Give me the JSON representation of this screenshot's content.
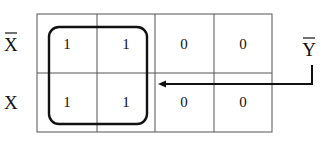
{
  "diagram": {
    "type": "karnaugh-map",
    "row_labels": [
      {
        "text": "X",
        "overline": true
      },
      {
        "text": "X",
        "overline": false
      }
    ],
    "cells": [
      [
        "1",
        "1",
        "0",
        "0"
      ],
      [
        "1",
        "1",
        "0",
        "0"
      ]
    ],
    "group": {
      "rows": [
        0,
        1
      ],
      "cols": [
        0,
        1
      ]
    },
    "term_label": {
      "text": "Y",
      "overline": true
    },
    "colors": {
      "line": "#555555",
      "loop": "#111111",
      "text": "#111111"
    }
  }
}
